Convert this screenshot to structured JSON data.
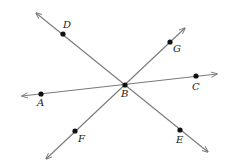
{
  "diagram": {
    "type": "intersecting-lines",
    "colors": {
      "line": "#7a7a7a",
      "point": "#111111",
      "label": "#222222",
      "background": "#ffffff"
    },
    "lines": [
      {
        "name": "line-DE",
        "from": [
          36,
          13
        ],
        "to": [
          208,
          152
        ],
        "through": [
          "D",
          "B",
          "E"
        ]
      },
      {
        "name": "line-AC",
        "from": [
          22,
          96
        ],
        "to": [
          217,
          74
        ],
        "through": [
          "A",
          "B",
          "C"
        ]
      },
      {
        "name": "line-FG",
        "from": [
          46,
          159
        ],
        "to": [
          185,
          28
        ],
        "through": [
          "F",
          "B",
          "G"
        ]
      }
    ],
    "points": [
      {
        "id": "D",
        "label": "D",
        "x": 63,
        "y": 34,
        "lx": 63,
        "ly": 28
      },
      {
        "id": "G",
        "label": "G",
        "x": 170,
        "y": 42,
        "lx": 173,
        "ly": 52
      },
      {
        "id": "C",
        "label": "C",
        "x": 196,
        "y": 76,
        "lx": 192,
        "ly": 90
      },
      {
        "id": "A",
        "label": "A",
        "x": 41,
        "y": 94,
        "lx": 37,
        "ly": 106
      },
      {
        "id": "B",
        "label": "B",
        "x": 125,
        "y": 85,
        "lx": 121,
        "ly": 97
      },
      {
        "id": "F",
        "label": "F",
        "x": 75,
        "y": 131,
        "lx": 78,
        "ly": 142
      },
      {
        "id": "E",
        "label": "E",
        "x": 180,
        "y": 130,
        "lx": 176,
        "ly": 143
      }
    ]
  }
}
